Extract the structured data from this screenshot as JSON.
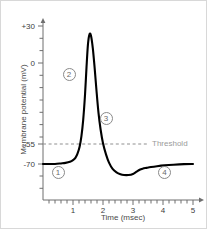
{
  "chart_data": {
    "type": "line",
    "title": "",
    "xlabel": "Time (msec)",
    "ylabel": "Membrane potential (mV)",
    "xlim": [
      0,
      5.2
    ],
    "ylim": [
      -85,
      35
    ],
    "grid": false,
    "legend_position": "none",
    "xticks": [
      1,
      2,
      3,
      4,
      5
    ],
    "xtick_labels": [
      "1",
      "2",
      "3",
      "4",
      "5"
    ],
    "yticks": [
      30,
      0,
      -55,
      -70
    ],
    "ytick_labels": [
      "+30",
      "0",
      "-55",
      "-70"
    ],
    "series": [
      {
        "name": "Action potential",
        "color": "#000000",
        "x": [
          0.0,
          0.2,
          0.4,
          0.6,
          0.75,
          0.9,
          1.0,
          1.08,
          1.15,
          1.22,
          1.28,
          1.34,
          1.4,
          1.45,
          1.5,
          1.55,
          1.6,
          1.66,
          1.72,
          1.78,
          1.85,
          1.92,
          2.0,
          2.1,
          2.2,
          2.32,
          2.45,
          2.58,
          2.7,
          2.85,
          3.0,
          3.12,
          3.22,
          3.32,
          3.45,
          3.6,
          3.8,
          4.05,
          4.35,
          4.7,
          5.0
        ],
        "y": [
          -70,
          -70,
          -70,
          -69.6,
          -69.2,
          -68.4,
          -67.2,
          -65.5,
          -62.5,
          -57.5,
          -50.0,
          -38.0,
          -20.0,
          0.0,
          17.0,
          24.0,
          23.0,
          14.0,
          0.0,
          -16.0,
          -33.0,
          -45.0,
          -55.0,
          -63.0,
          -69.0,
          -73.5,
          -76.0,
          -77.4,
          -78.0,
          -78.0,
          -77.2,
          -75.6,
          -74.2,
          -73.4,
          -72.8,
          -72.2,
          -71.6,
          -71.0,
          -70.5,
          -70.1,
          -70.0
        ]
      }
    ],
    "reference_lines": [
      {
        "name": "threshold",
        "label": "Threshold",
        "value": -55,
        "orientation": "horizontal",
        "style": "dashed",
        "color": "#8f8f8f"
      }
    ],
    "annotations": [
      {
        "label": "1",
        "x_msec": 0.5,
        "y_mv": -76.5
      },
      {
        "label": "2",
        "x_msec": 0.87,
        "y_mv": -5.0
      },
      {
        "label": "3",
        "x_msec": 2.1,
        "y_mv": -37.0
      },
      {
        "label": "4",
        "x_msec": 4.05,
        "y_mv": -76.5
      }
    ]
  }
}
